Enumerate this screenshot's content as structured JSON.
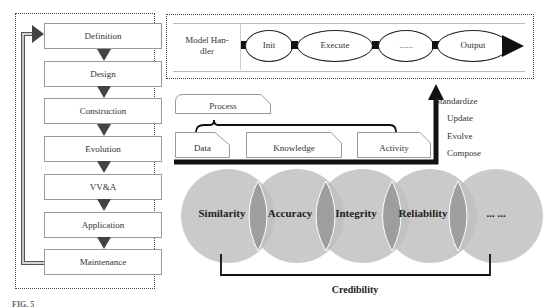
{
  "lifecycle": {
    "stages": [
      {
        "label": "Definition"
      },
      {
        "label": "Design"
      },
      {
        "label": "Construction"
      },
      {
        "label": "Evolution"
      },
      {
        "label": "VV&A"
      },
      {
        "label": "Application"
      },
      {
        "label": "Maintenance"
      }
    ]
  },
  "model_handler": {
    "label_line1": "Model Han-",
    "label_line2": "dler",
    "steps": [
      {
        "label": "Init"
      },
      {
        "label": "Execute"
      },
      {
        "label": "......"
      },
      {
        "label": "Output"
      }
    ]
  },
  "composition": {
    "process_label": "Process",
    "items": [
      {
        "label": "Data"
      },
      {
        "label": "Knowledge"
      },
      {
        "label": "Activity"
      }
    ],
    "operations": [
      {
        "label": "Standardize"
      },
      {
        "label": "Update"
      },
      {
        "label": "Evolve"
      },
      {
        "label": "Compose"
      }
    ]
  },
  "credibility": {
    "attributes": [
      {
        "label": "Similarity"
      },
      {
        "label": "Accuracy"
      },
      {
        "label": "Integrity"
      },
      {
        "label": "Reliability"
      },
      {
        "label": "... ..."
      }
    ],
    "title": "Credibility"
  },
  "caption": {
    "text": "FIG. 5"
  },
  "colors": {
    "circle_fill": "#bebebe",
    "overlap_fill": "#9a9a9a",
    "arrow": "#111111",
    "box_border": "#9a9a9a"
  }
}
